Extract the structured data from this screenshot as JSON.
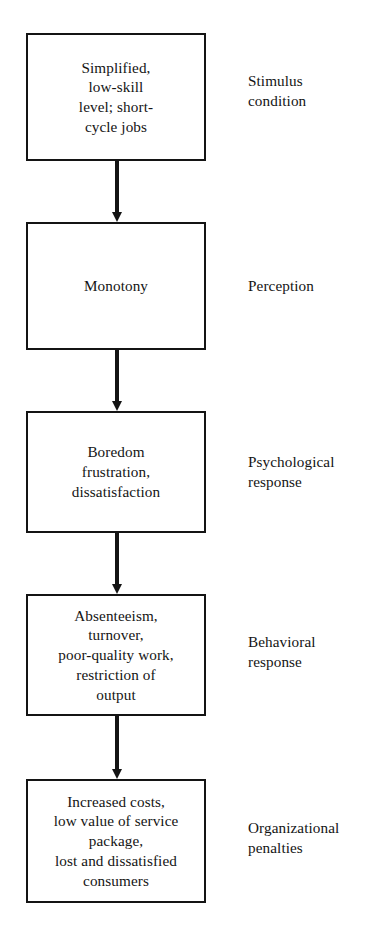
{
  "diagram": {
    "background_color": "#ffffff",
    "line_color": "#141414",
    "text_color": "#141414",
    "nodes": [
      {
        "id": "stimulus",
        "text": "Simplified,\nlow-skill\nlevel; short-\ncycle jobs",
        "label": "Stimulus\ncondition"
      },
      {
        "id": "perception",
        "text": "Monotony",
        "label": "Perception"
      },
      {
        "id": "psychological",
        "text": "Boredom\nfrustration,\ndissatisfaction",
        "label": "Psychological\nresponse"
      },
      {
        "id": "behavioral",
        "text": "Absenteeism,\nturnover,\npoor-quality work,\nrestriction of\noutput",
        "label": "Behavioral\nresponse"
      },
      {
        "id": "organizational",
        "text": "Increased costs,\nlow value of service\npackage,\nlost and dissatisfied\nconsumers",
        "label": "Organizational\npenalties"
      }
    ],
    "connectors": [
      {
        "id": "arrow-stimulus-to-perception",
        "icon": "down-arrow-icon"
      },
      {
        "id": "arrow-perception-to-psychological",
        "icon": "down-arrow-icon"
      },
      {
        "id": "arrow-psychological-to-behavioral",
        "icon": "down-arrow-icon"
      },
      {
        "id": "arrow-behavioral-to-organizational",
        "icon": "down-arrow-icon"
      }
    ]
  }
}
